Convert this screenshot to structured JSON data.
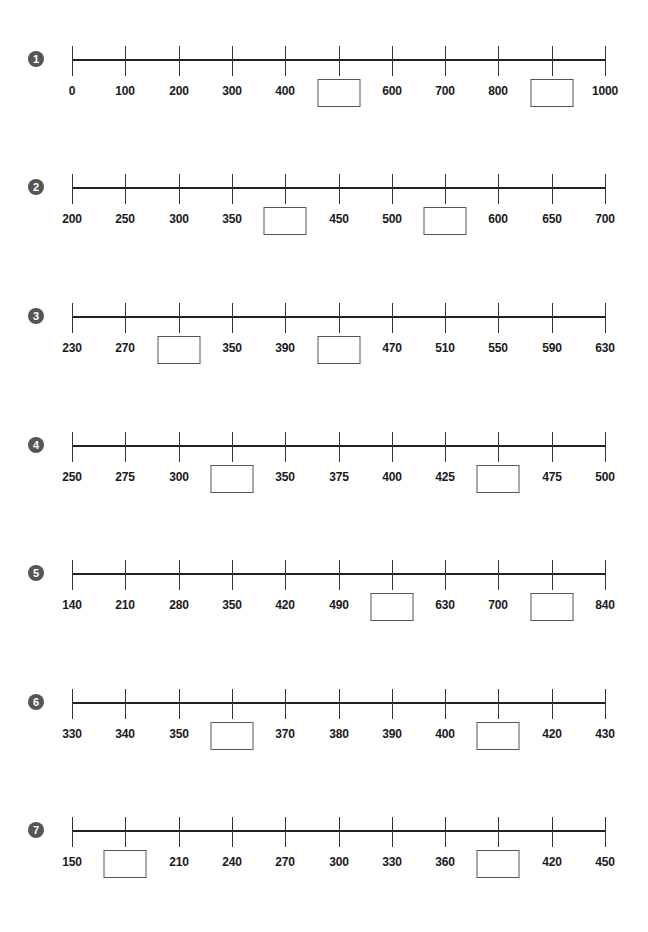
{
  "worksheet": {
    "problems": [
      {
        "number": "1",
        "ticks": [
          "0",
          "100",
          "200",
          "300",
          "400",
          "",
          "600",
          "700",
          "800",
          "",
          "1000"
        ],
        "blank_positions": [
          5,
          9
        ],
        "top": 59
      },
      {
        "number": "2",
        "ticks": [
          "200",
          "250",
          "300",
          "350",
          "",
          "450",
          "500",
          "",
          "600",
          "650",
          "700"
        ],
        "blank_positions": [
          4,
          7
        ],
        "top": 187
      },
      {
        "number": "3",
        "ticks": [
          "230",
          "270",
          "",
          "350",
          "390",
          "",
          "470",
          "510",
          "550",
          "590",
          "630"
        ],
        "blank_positions": [
          2,
          5
        ],
        "top": 316
      },
      {
        "number": "4",
        "ticks": [
          "250",
          "275",
          "300",
          "",
          "350",
          "375",
          "400",
          "425",
          "",
          "475",
          "500"
        ],
        "blank_positions": [
          3,
          8
        ],
        "top": 445
      },
      {
        "number": "5",
        "ticks": [
          "140",
          "210",
          "280",
          "350",
          "420",
          "490",
          "",
          "630",
          "700",
          "",
          "840"
        ],
        "blank_positions": [
          6,
          9
        ],
        "top": 573
      },
      {
        "number": "6",
        "ticks": [
          "330",
          "340",
          "350",
          "",
          "370",
          "380",
          "390",
          "400",
          "",
          "420",
          "430"
        ],
        "blank_positions": [
          3,
          8
        ],
        "top": 702
      },
      {
        "number": "7",
        "ticks": [
          "150",
          "",
          "210",
          "240",
          "270",
          "300",
          "330",
          "360",
          "",
          "420",
          "450"
        ],
        "blank_positions": [
          1,
          8
        ],
        "top": 830
      }
    ]
  },
  "colors": {
    "badge": "#555555",
    "axis": "#222222",
    "box_border": "#555555"
  }
}
